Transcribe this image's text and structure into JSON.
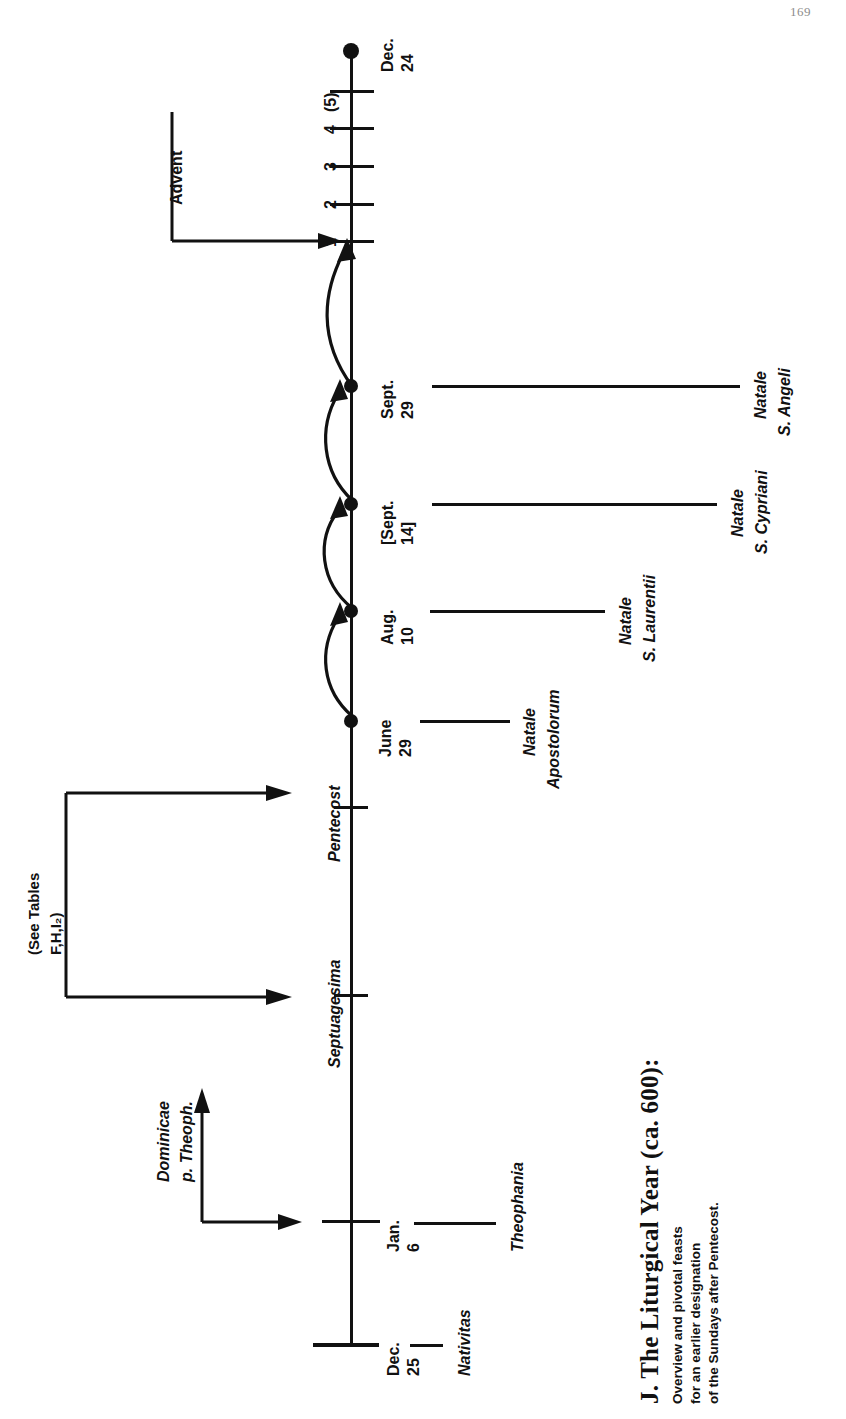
{
  "page": {
    "number": "169"
  },
  "caption": {
    "title": "J. The Liturgical Year (ca. 600):",
    "subtitle_lines": [
      "Overview and pivotal feasts",
      "for an earlier designation",
      "of the Sundays after Pentecost."
    ]
  },
  "diagram": {
    "type": "timeline",
    "orientation": "vertical-rotated",
    "bracket_labels": {
      "advent": "Advent",
      "see_tables_line1": "(See Tables",
      "see_tables_line2": "F,H,I₂",
      "see_tables_close": ")",
      "dominicae_line1": "Dominicae",
      "dominicae_line2": "p. Theoph."
    },
    "advent_sunday_ticks": [
      "1",
      "2",
      "3",
      "4",
      "(5)"
    ],
    "nodes": [
      {
        "id": "dec24",
        "date_line1": "Dec.",
        "date_line2": "24",
        "marker": "dot",
        "feast_line1": "",
        "feast_line2": ""
      },
      {
        "id": "sept29",
        "date_line1": "Sept.",
        "date_line2": "29",
        "marker": "dot",
        "feast_line1": "Natale",
        "feast_line2": "S. Angeli"
      },
      {
        "id": "sept14",
        "date_line1": "[Sept.",
        "date_line2": "14]",
        "marker": "dot",
        "feast_line1": "Natale",
        "feast_line2": "S. Cypriani"
      },
      {
        "id": "aug10",
        "date_line1": "Aug.",
        "date_line2": "10",
        "marker": "dot",
        "feast_line1": "Natale",
        "feast_line2": "S. Laurentii"
      },
      {
        "id": "june29",
        "date_line1": "June",
        "date_line2": "29",
        "marker": "dot",
        "feast_line1": "Natale",
        "feast_line2": "Apostolorum"
      },
      {
        "id": "pentecost",
        "date_line1": "Pentecost",
        "date_line2": "",
        "marker": "tick",
        "feast_line1": "",
        "feast_line2": ""
      },
      {
        "id": "septuagesima",
        "date_line1": "Septuagesima",
        "date_line2": "",
        "marker": "tick",
        "feast_line1": "",
        "feast_line2": ""
      },
      {
        "id": "jan6",
        "date_line1": "Jan.",
        "date_line2": "6",
        "marker": "tick",
        "feast_line1": "Theophania",
        "feast_line2": ""
      },
      {
        "id": "dec25",
        "date_line1": "Dec.",
        "date_line2": "25",
        "marker": "tick-end",
        "feast_line1": "Nativitas",
        "feast_line2": ""
      }
    ],
    "colors": {
      "ink": "#111111",
      "paper": "#ffffff"
    }
  }
}
